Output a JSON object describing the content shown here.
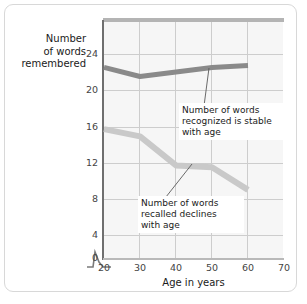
{
  "chart_data": {
    "type": "line",
    "title": "",
    "subtitle": "",
    "xlabel": "Age in years",
    "ylabel": "Number of words remembered",
    "xlim": [
      15,
      70
    ],
    "ylim": [
      0,
      26
    ],
    "xticks": [
      20,
      30,
      40,
      50,
      60,
      70
    ],
    "xticklabels": [
      "20",
      "30",
      "40",
      "50",
      "60",
      "70"
    ],
    "yticks": [
      0,
      4,
      8,
      12,
      16,
      20,
      24
    ],
    "yticklabels": [
      "0",
      "4",
      "8",
      "12",
      "16",
      "20",
      "24"
    ],
    "grid": true,
    "grid_axis": "both",
    "axis_break": true,
    "legend": "none",
    "x": [
      20,
      30,
      40,
      50,
      60
    ],
    "series": [
      {
        "name": "Number of words recognized",
        "values": [
          21.0,
          20.0,
          20.5,
          21.0,
          21.2
        ],
        "color": "#8a8a8a"
      },
      {
        "name": "Number of words recalled",
        "values": [
          14.2,
          13.4,
          10.2,
          10.0,
          7.5
        ],
        "color": "#c9c9c9"
      }
    ],
    "annotations": [
      {
        "id": "recognized",
        "text": "Number of words recognized is stable with age",
        "lines": [
          "Number of words",
          "recognized is stable",
          "with age"
        ],
        "points_to": {
          "x": 52,
          "y": 21.0
        }
      },
      {
        "id": "recalled",
        "text": "Number of words recalled declines with age",
        "lines": [
          "Number of words",
          "recalled declines",
          "with age"
        ],
        "points_to": {
          "x": 47,
          "y": 10.1
        }
      }
    ]
  },
  "axis": {
    "y_title_lines": [
      "Number",
      "of words",
      "remembered"
    ],
    "x_title": "Age in years"
  },
  "colors": {
    "plot_background": "#f6f6f6",
    "grid": "#cdcdcd",
    "y_axis": "#6f6f6f",
    "x_axis": "#b9b9b9",
    "top_bar": "#b4b4b4",
    "series_recognized": "#8a8a8a",
    "series_recalled": "#c9c9c9",
    "frame": "#d8d8d8",
    "text": "#1a1a1a"
  }
}
